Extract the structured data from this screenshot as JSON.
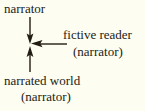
{
  "diagram": {
    "background_color": "#fdfdf2",
    "ink_color": "#221c14",
    "nodes": [
      {
        "id": "narrator-top",
        "label": "narrator",
        "position": "top-left"
      },
      {
        "id": "fictive-reader",
        "label": "fictive reader",
        "sublabel": "(narrator)",
        "position": "middle-right"
      },
      {
        "id": "narrated-world",
        "label": "narrated world",
        "sublabel": "(narrator)",
        "position": "bottom-left"
      }
    ],
    "arrows": [
      {
        "id": "arrow-from-narrator",
        "from": "narrator-top",
        "to": "center",
        "direction": "down",
        "head": "at-center"
      },
      {
        "id": "arrow-from-fictive-reader",
        "from": "fictive-reader",
        "to": "center",
        "direction": "left",
        "head": "at-center"
      },
      {
        "id": "arrow-from-narrated-world",
        "from": "narrated-world",
        "to": "center",
        "direction": "up",
        "head": "at-center"
      }
    ],
    "convergence_point": {
      "x": 30,
      "y": 44
    }
  }
}
